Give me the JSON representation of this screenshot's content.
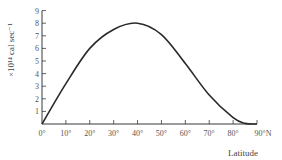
{
  "chart_data": {
    "type": "line",
    "title": "",
    "xlabel": "Latitude",
    "ylabel": "×10¹⁴ cal sec⁻¹",
    "x": [
      0,
      10,
      20,
      30,
      40,
      50,
      60,
      70,
      80,
      85,
      90
    ],
    "series": [
      {
        "name": "curve",
        "values": [
          0,
          3.2,
          6.0,
          7.5,
          8.0,
          7.1,
          4.8,
          2.3,
          0.5,
          0.05,
          0
        ]
      }
    ],
    "xlim": [
      0,
      90
    ],
    "ylim": [
      0,
      9
    ],
    "x_ticks": [
      "0°",
      "10°",
      "20°",
      "30°",
      "40°",
      "50°",
      "60°",
      "70°",
      "80°",
      "90°N"
    ],
    "y_ticks": [
      "1",
      "2",
      "3",
      "4",
      "5",
      "6",
      "7",
      "8",
      "9"
    ],
    "grid": false,
    "legend": "none"
  },
  "colors": {
    "line": "#2a2a2a",
    "axis": "#3a3a3a",
    "text": "#555555"
  }
}
